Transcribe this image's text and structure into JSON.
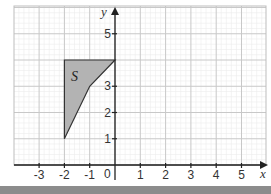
{
  "diagram": {
    "type": "coordinate-grid",
    "x_axis": {
      "label": "x",
      "min": -4,
      "max": 5.9,
      "ticks": [
        -3,
        -2,
        -1,
        1,
        2,
        3,
        4,
        5
      ],
      "origin_label": "0"
    },
    "y_axis": {
      "label": "y",
      "min": -0.6,
      "max": 6,
      "ticks": [
        1,
        2,
        3,
        5
      ]
    },
    "shape": {
      "label": "S",
      "vertices": [
        [
          -2,
          4
        ],
        [
          0,
          4
        ],
        [
          -1,
          3
        ],
        [
          -2,
          1
        ]
      ],
      "fill": "#b3b3b3",
      "stroke": "#333333"
    },
    "grid": {
      "major_step": 1,
      "minor_step": 0.2,
      "major_color": "#c8c8c8",
      "minor_color": "#ececec"
    }
  },
  "labels": {
    "x_axis": "x",
    "y_axis": "y",
    "origin": "0",
    "shape": "S",
    "x_ticks": [
      "-3",
      "-2",
      "-1",
      "1",
      "2",
      "3",
      "4",
      "5"
    ],
    "y_ticks": [
      "1",
      "2",
      "3",
      "5"
    ]
  }
}
